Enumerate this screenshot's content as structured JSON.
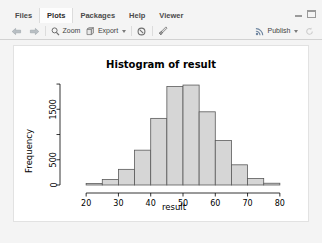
{
  "window": {
    "minimize_icon": "minimize-icon",
    "maximize_icon": "maximize-icon"
  },
  "tabstrip": {
    "tabs": [
      {
        "label": "Files",
        "active": false
      },
      {
        "label": "Plots",
        "active": true
      },
      {
        "label": "Packages",
        "active": false
      },
      {
        "label": "Help",
        "active": false
      },
      {
        "label": "Viewer",
        "active": false
      }
    ]
  },
  "toolbar": {
    "back_icon": "back-arrow-icon",
    "forward_icon": "forward-arrow-icon",
    "zoom_label": "Zoom",
    "zoom_icon": "magnifier-icon",
    "export_label": "Export",
    "export_icon": "export-icon",
    "export_caret": "chevron-down-icon",
    "remove_icon": "remove-plot-icon",
    "clear_all_icon": "clear-all-plots-icon",
    "publish_label": "Publish",
    "publish_icon": "publish-icon",
    "publish_caret": "chevron-down-icon",
    "refresh_icon": "refresh-icon"
  },
  "chart_data": {
    "type": "bar",
    "title": "Histogram of result",
    "xlabel": "result",
    "ylabel": "Frequency",
    "xlim": [
      15,
      85
    ],
    "ylim": [
      0,
      2100
    ],
    "grid": false,
    "legend": null,
    "xticks": [
      20,
      30,
      40,
      50,
      60,
      70,
      80
    ],
    "yticks": [
      0,
      500,
      1000,
      1500,
      2000
    ],
    "ytick_labels": [
      "0",
      "500",
      "",
      "1500",
      ""
    ],
    "bin_width": 5,
    "bin_starts": [
      20,
      25,
      30,
      35,
      40,
      45,
      50,
      55,
      60,
      65,
      70,
      75
    ],
    "categories": [
      "20-25",
      "25-30",
      "30-35",
      "35-40",
      "40-45",
      "45-50",
      "50-55",
      "55-60",
      "60-65",
      "65-70",
      "70-75",
      "75-80"
    ],
    "values": [
      30,
      110,
      310,
      690,
      1320,
      1950,
      1980,
      1450,
      880,
      400,
      130,
      35
    ],
    "bar_fill": "#d6d6d6",
    "bar_stroke": "#5a5a5a"
  }
}
